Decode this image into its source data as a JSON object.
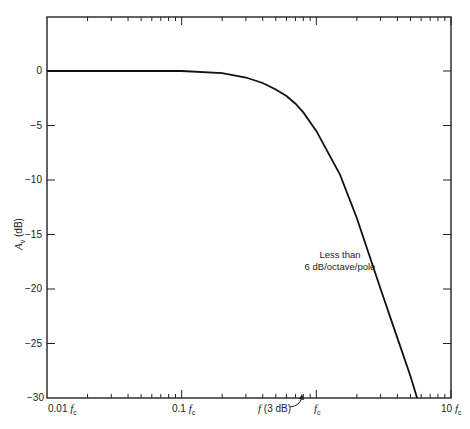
{
  "chart_data": {
    "type": "line",
    "title": "",
    "xlabel": "frequency (log scale, relative to f_c)",
    "ylabel": "A_v (dB)",
    "xscale": "log",
    "xlim": [
      0.01,
      10
    ],
    "ylim": [
      -30,
      5
    ],
    "grid": false,
    "x_tick_labels": [
      "0.01 f_c",
      "0.1 f_c",
      "f_c",
      "10 f_c"
    ],
    "y_ticks": [
      0,
      -5,
      -10,
      -15,
      -20,
      -25,
      -30
    ],
    "y_tick_labels": [
      "0",
      "-5",
      "-10",
      "-15",
      "-20",
      "-25",
      "-30"
    ],
    "series": [
      {
        "name": "Response",
        "x": [
          0.01,
          0.05,
          0.1,
          0.2,
          0.3,
          0.4,
          0.5,
          0.6,
          0.7,
          0.8,
          1.0,
          1.5,
          2.0,
          3.0,
          4.0,
          5.0,
          5.6
        ],
        "values": [
          0,
          0,
          0,
          -0.2,
          -0.6,
          -1.1,
          -1.7,
          -2.3,
          -3.0,
          -3.8,
          -5.5,
          -9.5,
          -13.5,
          -20,
          -24.5,
          -28,
          -30
        ]
      }
    ],
    "annotations": [
      {
        "text": "Less than\n6 dB/octave/pole",
        "x": 1.8,
        "y": -21
      },
      {
        "text": "f (3 dB)",
        "x": 0.7,
        "y": -30,
        "arrow": true
      }
    ]
  },
  "labels": {
    "y_axis_title_main": "A",
    "y_axis_title_sub": "v",
    "y_axis_title_unit": " (dB)",
    "x_ticks": [
      "0.01",
      "0.1",
      "",
      "10"
    ],
    "fc": "f",
    "fc_sub": "c",
    "y_ticks": [
      "0",
      "−5",
      "−10",
      "−15",
      "−20",
      "−25",
      "−30"
    ],
    "note_line1": "Less than",
    "note_line2": "6 dB/octave/pole",
    "f3db_f": "f",
    "f3db_rest": "(3 dB)"
  }
}
